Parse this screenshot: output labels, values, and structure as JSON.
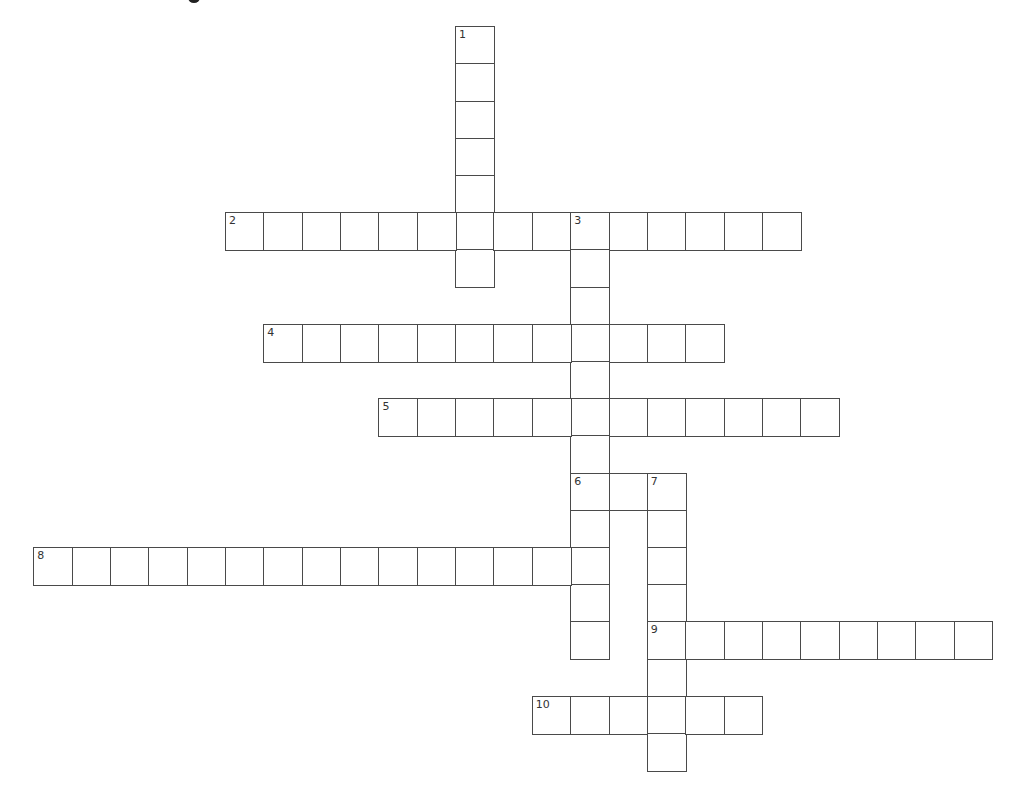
{
  "grid": {
    "origin_x": 34,
    "origin_y": 27,
    "cell_width": 38.35,
    "cell_height": 37.2,
    "columns": 25,
    "rows": 20,
    "border_color": "#4a4a4a",
    "background_color": "#ffffff"
  },
  "words": [
    {
      "number": "1",
      "direction": "down",
      "row": 0,
      "col": 11,
      "length": 7
    },
    {
      "number": "2",
      "direction": "across",
      "row": 5,
      "col": 5,
      "length": 15
    },
    {
      "number": "3",
      "direction": "down",
      "row": 5,
      "col": 14,
      "length": 12
    },
    {
      "number": "4",
      "direction": "across",
      "row": 8,
      "col": 6,
      "length": 12
    },
    {
      "number": "5",
      "direction": "across",
      "row": 10,
      "col": 9,
      "length": 12
    },
    {
      "number": "6",
      "direction": "across",
      "row": 12,
      "col": 14,
      "length": 3
    },
    {
      "number": "7",
      "direction": "down",
      "row": 12,
      "col": 16,
      "length": 8
    },
    {
      "number": "8",
      "direction": "across",
      "row": 14,
      "col": 0,
      "length": 15
    },
    {
      "number": "9",
      "direction": "across",
      "row": 16,
      "col": 16,
      "length": 9
    },
    {
      "number": "10",
      "direction": "across",
      "row": 18,
      "col": 13,
      "length": 6
    }
  ]
}
